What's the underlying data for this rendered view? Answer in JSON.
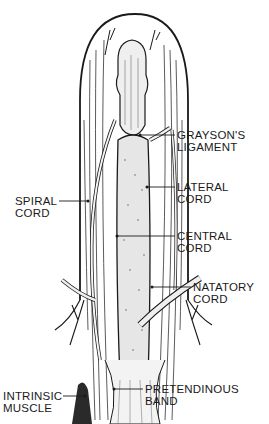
{
  "figure": {
    "colors": {
      "ink": "#1a1a1a",
      "background": "#ffffff",
      "shade": "#cfcfcf"
    }
  },
  "labels": {
    "graysons": {
      "line1": "GRAYSON'S",
      "line2": "LIGAMENT"
    },
    "lateral": {
      "line1": "LATERAL",
      "line2": "CORD"
    },
    "spiral": {
      "line1": "SPIRAL",
      "line2": "CORD"
    },
    "central": {
      "line1": "CENTRAL",
      "line2": "CORD"
    },
    "natatory": {
      "line1": "NATATORY",
      "line2": "CORD"
    },
    "intrinsic": {
      "line1": "INTRINSIC",
      "line2": "MUSCLE"
    },
    "pretendinous": {
      "line1": "PRETENDINOUS",
      "line2": "BAND"
    }
  }
}
